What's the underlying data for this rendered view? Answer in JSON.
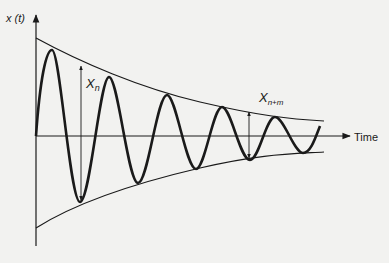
{
  "diagram": {
    "type": "damped-oscillation",
    "y_axis_label": "x (t)",
    "x_axis_label": "Time",
    "amplitude_labels": {
      "first": {
        "base": "X",
        "sub": "n"
      },
      "second": {
        "base": "X",
        "sub": "n+m"
      }
    },
    "colors": {
      "ink": "#1a1a1a",
      "background": "#f2f2f0"
    },
    "geometry": {
      "origin": [
        36,
        136
      ],
      "y_axis": {
        "top": 13,
        "bottom": 246
      },
      "x_axis": {
        "end": 350
      },
      "upper_envelope": [
        [
          36,
          38
        ],
        [
          52,
          49
        ],
        [
          109,
          76
        ],
        [
          167,
          94
        ],
        [
          222,
          107
        ],
        [
          275,
          117
        ],
        [
          324,
          121
        ]
      ],
      "lower_envelope": [
        [
          36,
          228
        ],
        [
          80,
          202
        ],
        [
          138,
          183
        ],
        [
          196,
          169
        ],
        [
          250,
          160
        ],
        [
          303,
          153
        ],
        [
          324,
          152
        ]
      ],
      "peaks": [
        [
          52,
          50
        ],
        [
          109,
          77
        ],
        [
          167,
          95
        ],
        [
          222,
          107
        ],
        [
          275,
          117
        ]
      ],
      "troughs": [
        [
          80,
          202
        ],
        [
          138,
          183
        ],
        [
          196,
          169
        ],
        [
          250,
          160
        ],
        [
          303,
          153
        ]
      ],
      "arrow_n": {
        "x": 81,
        "y1": 65,
        "y2": 202
      },
      "arrow_nm": {
        "x": 249,
        "y1": 111,
        "y2": 160
      }
    }
  }
}
